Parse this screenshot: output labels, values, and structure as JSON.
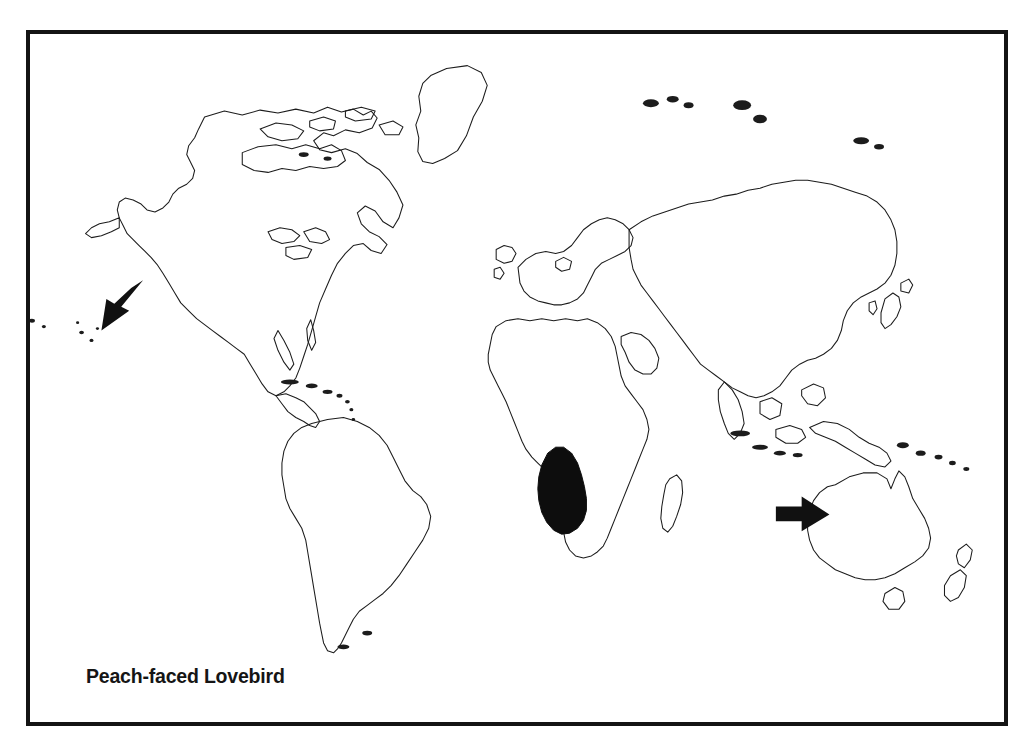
{
  "figure": {
    "caption": "Peach-faced Lovebird",
    "frame_color": "#141414",
    "background_color": "#ffffff",
    "coastline_color": "#1c1c1c",
    "range_fill_color": "#0d0d0d",
    "arrow_color": "#111111"
  },
  "map": {
    "type": "world-distribution-map",
    "projection_hint": "rectangular world outline, Pacific split at left and right edges",
    "landmasses": [
      "North America",
      "South America",
      "Greenland",
      "Europe",
      "Africa",
      "Asia",
      "Australia",
      "New Zealand",
      "Madagascar",
      "Indonesia and New Guinea",
      "Japan",
      "British Isles",
      "Canadian Arctic Archipelago",
      "Hawaiian Islands",
      "Caribbean Islands"
    ],
    "range_patches": [
      {
        "name": "native-range-southwest-africa",
        "region": "Southwestern Africa (Namibia, southwest Angola, western South Africa)",
        "style": "solid black fill"
      }
    ],
    "annotations": [
      {
        "name": "arrow-hawaii",
        "direction": "down-left",
        "points_at": "Hawaiian Islands",
        "meaning": "introduced population"
      },
      {
        "name": "arrow-australia",
        "direction": "right",
        "points_at": "Western Australia",
        "meaning": "introduced population"
      }
    ]
  }
}
